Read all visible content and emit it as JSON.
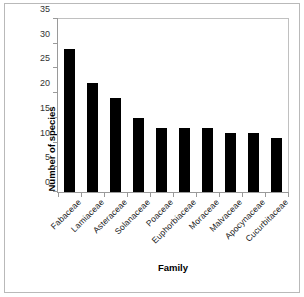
{
  "chart_data": {
    "type": "bar",
    "title": "",
    "xlabel": "Family",
    "ylabel": "Number of species",
    "categories": [
      "Fabaceae",
      "Lamiaceae",
      "Asteraceae",
      "Solanaceae",
      "Poaceae",
      "Euphorbiaceae",
      "Moraceae",
      "Malvaceae",
      "Apocynaceae",
      "Cucurbitaceae"
    ],
    "values": [
      29,
      22,
      19,
      15,
      13,
      13,
      13,
      12,
      12,
      11
    ],
    "ylim": [
      0,
      35
    ],
    "yticks": [
      0,
      5,
      10,
      15,
      20,
      25,
      30,
      35
    ],
    "ytick_labels": [
      "0",
      "5",
      "10",
      "15",
      "20",
      "25",
      "30",
      "35"
    ],
    "grid": false,
    "legend": "none",
    "bar_color": "#000000",
    "axis_color": "#9a9a9a",
    "frame_color": "#b9b9b9",
    "background": "#ffffff"
  }
}
